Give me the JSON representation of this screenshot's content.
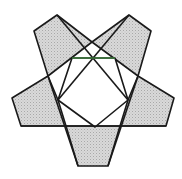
{
  "colors": {
    "fill": "#d9d9d9",
    "dot": "#b3b3b3",
    "stroke": "#1a1a1a",
    "accent_edge": "#3a7a3a",
    "background": "#ffffff"
  },
  "shapes": {
    "arms": [
      {
        "name": "top-left",
        "points": "34,31 57,15 92,42 48,76"
      },
      {
        "name": "top-right",
        "points": "92,42 129,15 151,31 138,76"
      },
      {
        "name": "left",
        "points": "48,76 12,98 21,126 66,126 58,100"
      },
      {
        "name": "right",
        "points": "138,76 174,98 166,126 120,126 128,100"
      },
      {
        "name": "bottom",
        "points": "66,126 120,126 108,166 78,166"
      }
    ],
    "inner_pentagon": "72,58 115,58 128,100 95,127 58,100",
    "accent_edge": {
      "x1": 72,
      "y1": 58,
      "x2": 115,
      "y2": 58
    }
  }
}
